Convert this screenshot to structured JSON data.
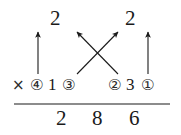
{
  "figure": {
    "type": "multiplication-lattice-diagram",
    "background_color": "#ffffff",
    "ink_color": "#1a1a1a"
  },
  "top_row": {
    "label": "carry-digits",
    "digits": [
      {
        "text": "2",
        "x": 50,
        "y": 8
      },
      {
        "text": "2",
        "x": 125,
        "y": 8
      }
    ]
  },
  "middle_row": {
    "label": "operand-row",
    "operator": {
      "text": "×",
      "x": 12,
      "y": 78
    },
    "items": [
      {
        "text": "④",
        "x": 30,
        "y": 78,
        "kind": "circled-step",
        "step": 4
      },
      {
        "text": "1",
        "x": 48,
        "y": 76,
        "kind": "digit"
      },
      {
        "text": "③",
        "x": 62,
        "y": 78,
        "kind": "circled-step",
        "step": 3
      },
      {
        "text": "②",
        "x": 108,
        "y": 78,
        "kind": "circled-step",
        "step": 2
      },
      {
        "text": "3",
        "x": 126,
        "y": 76,
        "kind": "digit"
      },
      {
        "text": "①",
        "x": 141,
        "y": 78,
        "kind": "circled-step",
        "step": 1
      }
    ]
  },
  "rule": {
    "label": "horizontal-rule",
    "x1": 14,
    "x2": 170,
    "y": 104
  },
  "bottom_row": {
    "label": "product-digits",
    "digits": [
      {
        "text": "2",
        "x": 56,
        "y": 108
      },
      {
        "text": "8",
        "x": 92,
        "y": 108
      },
      {
        "text": "6",
        "x": 129,
        "y": 108
      }
    ]
  },
  "arrows": [
    {
      "name": "arrow-vertical-left",
      "x1": 38,
      "y1": 74,
      "x2": 38,
      "y2": 32,
      "style": "vertical"
    },
    {
      "name": "arrow-diagonal-left-up",
      "x1": 118,
      "y1": 74,
      "x2": 77,
      "y2": 32,
      "style": "diagonal"
    },
    {
      "name": "arrow-diagonal-right-up",
      "x1": 77,
      "y1": 74,
      "x2": 118,
      "y2": 32,
      "style": "diagonal"
    },
    {
      "name": "arrow-vertical-right",
      "x1": 148,
      "y1": 74,
      "x2": 148,
      "y2": 32,
      "style": "vertical"
    }
  ]
}
